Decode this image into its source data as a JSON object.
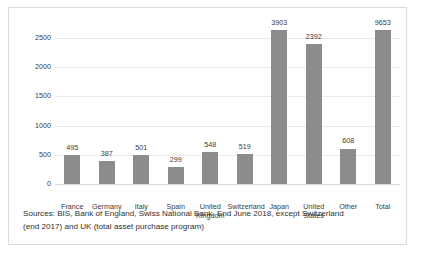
{
  "chart_data": {
    "type": "bar",
    "title": "",
    "subtitle": "",
    "xlabel": "",
    "ylabel": "",
    "ylim": [
      0,
      2500
    ],
    "grid": true,
    "legend": "none",
    "series_name": "",
    "bar_color": "#8c8c8c",
    "gridline_color": "#eaeaea",
    "axis_color": "#d9d9d9",
    "note": "Bars for Japan (3903) and Total (9653) exceed the 2500 axis maximum and are clipped at the top of the plot area.",
    "yticks": [
      "0",
      "500",
      "1000",
      "1500",
      "2000",
      "2500"
    ],
    "ytick_values": [
      0,
      500,
      1000,
      1500,
      2000,
      2500
    ],
    "categories": [
      "France",
      "Germany",
      "Italy",
      "Spain",
      "United\nKingdom",
      "Switzerland",
      "Japan",
      "United\nStates",
      "Other",
      "Total"
    ],
    "values": [
      495,
      387,
      501,
      299,
      548,
      519,
      3903,
      2392,
      608,
      9653
    ],
    "value_labels": [
      "495",
      "387",
      "501",
      "299",
      "548",
      "519",
      "3903",
      "2392",
      "608",
      "9653"
    ]
  },
  "source": {
    "line1": "Sources: BIS, Bank of England, Swiss National Bank. End June 2018, except Switzerland",
    "line2": "(end 2017) and UK (total asset purchase program)"
  }
}
